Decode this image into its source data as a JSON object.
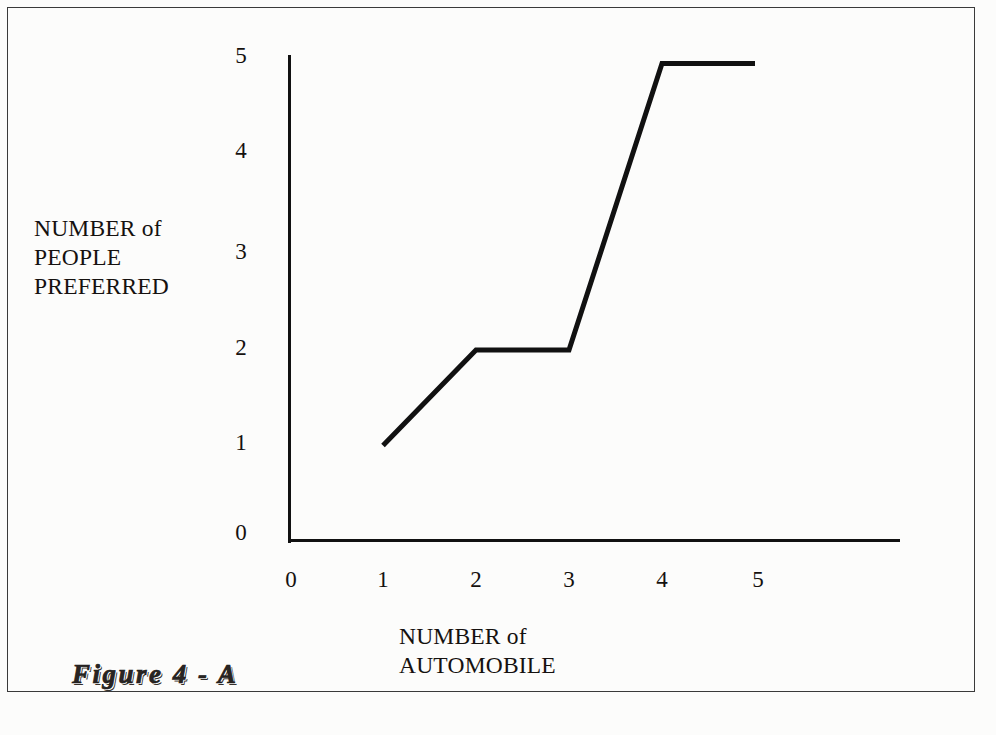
{
  "figure": {
    "caption": "Figure  4 - A",
    "background_color": "#fcfcfb",
    "ink_color": "#111111",
    "frame_color": "#3a3a3a"
  },
  "chart_data": {
    "type": "line",
    "title": "",
    "subtitle": "",
    "xlabel": "NUMBER of\nAUTOMOBILE",
    "ylabel": "NUMBER of\nPEOPLE\nPREFERRED",
    "x": [
      1,
      2,
      3,
      4,
      5
    ],
    "values": [
      1,
      2,
      2,
      5,
      5
    ],
    "series": [
      {
        "name": "people preferred",
        "x": [
          1,
          2,
          3,
          4,
          5
        ],
        "values": [
          1,
          2,
          2,
          5,
          5
        ],
        "color": "#111111",
        "line_width": 5
      }
    ],
    "xlim": [
      0,
      5
    ],
    "ylim": [
      0,
      5
    ],
    "x_ticks": [
      0,
      1,
      2,
      3,
      4,
      5
    ],
    "y_ticks": [
      0,
      1,
      2,
      3,
      4,
      5
    ],
    "x_tick_labels": [
      "0",
      "1",
      "2",
      "3",
      "4",
      "5"
    ],
    "y_tick_labels": [
      "0",
      "1",
      "2",
      "3",
      "4",
      "5"
    ],
    "grid": false,
    "legend": false,
    "legend_position": "none",
    "markers": false,
    "annotations": []
  },
  "axes": {
    "y_ticks": [
      {
        "label": "5",
        "top": 44
      },
      {
        "label": "4",
        "top": 139
      },
      {
        "label": "3",
        "top": 240
      },
      {
        "label": "2",
        "top": 336
      },
      {
        "label": "1",
        "top": 431
      },
      {
        "label": "0",
        "top": 521
      }
    ],
    "x_ticks": [
      {
        "label": "0",
        "left": 271
      },
      {
        "label": "1",
        "left": 363
      },
      {
        "label": "2",
        "left": 456
      },
      {
        "label": "3",
        "left": 549
      },
      {
        "label": "4",
        "left": 642
      },
      {
        "label": "5",
        "left": 738
      }
    ]
  },
  "geometry": {
    "origin_x": 290,
    "origin_y": 541,
    "x_unit_px": 93,
    "y_unit_px": 95.5,
    "x_axis_end": 898,
    "y_axis_top": 55
  }
}
